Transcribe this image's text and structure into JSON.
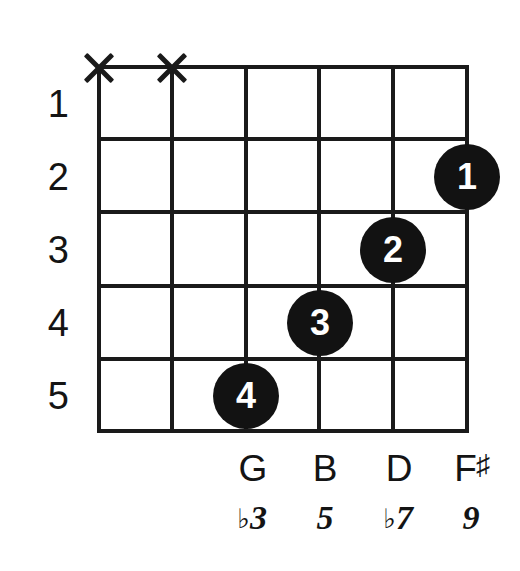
{
  "diagram": {
    "type": "guitar-chord-diagram",
    "fret_numbers": [
      "1",
      "2",
      "3",
      "4",
      "5"
    ],
    "strings": [
      {
        "index": 1,
        "marker": "x",
        "note": "",
        "interval": ""
      },
      {
        "index": 2,
        "marker": "x",
        "note": "",
        "interval": ""
      },
      {
        "index": 3,
        "marker": "",
        "note": "G",
        "note_accidental": "",
        "interval_number": "3",
        "interval_accidental": "♭"
      },
      {
        "index": 4,
        "marker": "",
        "note": "B",
        "note_accidental": "",
        "interval_number": "5",
        "interval_accidental": ""
      },
      {
        "index": 5,
        "marker": "",
        "note": "D",
        "note_accidental": "",
        "interval_number": "7",
        "interval_accidental": "♭"
      },
      {
        "index": 6,
        "marker": "",
        "note": "F",
        "note_accidental": "♯",
        "interval_number": "9",
        "interval_accidental": ""
      }
    ],
    "mute_markers": [
      {
        "string": 1,
        "glyph": "X"
      },
      {
        "string": 2,
        "glyph": "X"
      }
    ],
    "finger_dots": [
      {
        "label": "1",
        "string": 6,
        "fret": 2
      },
      {
        "label": "2",
        "string": 5,
        "fret": 3
      },
      {
        "label": "3",
        "string": 4,
        "fret": 4
      },
      {
        "label": "4",
        "string": 3,
        "fret": 5
      }
    ],
    "colors": {
      "ink": "#141414",
      "line": "#1a1a1a",
      "dot_fill": "#121212",
      "dot_text": "#ffffff",
      "background": "#ffffff"
    }
  }
}
